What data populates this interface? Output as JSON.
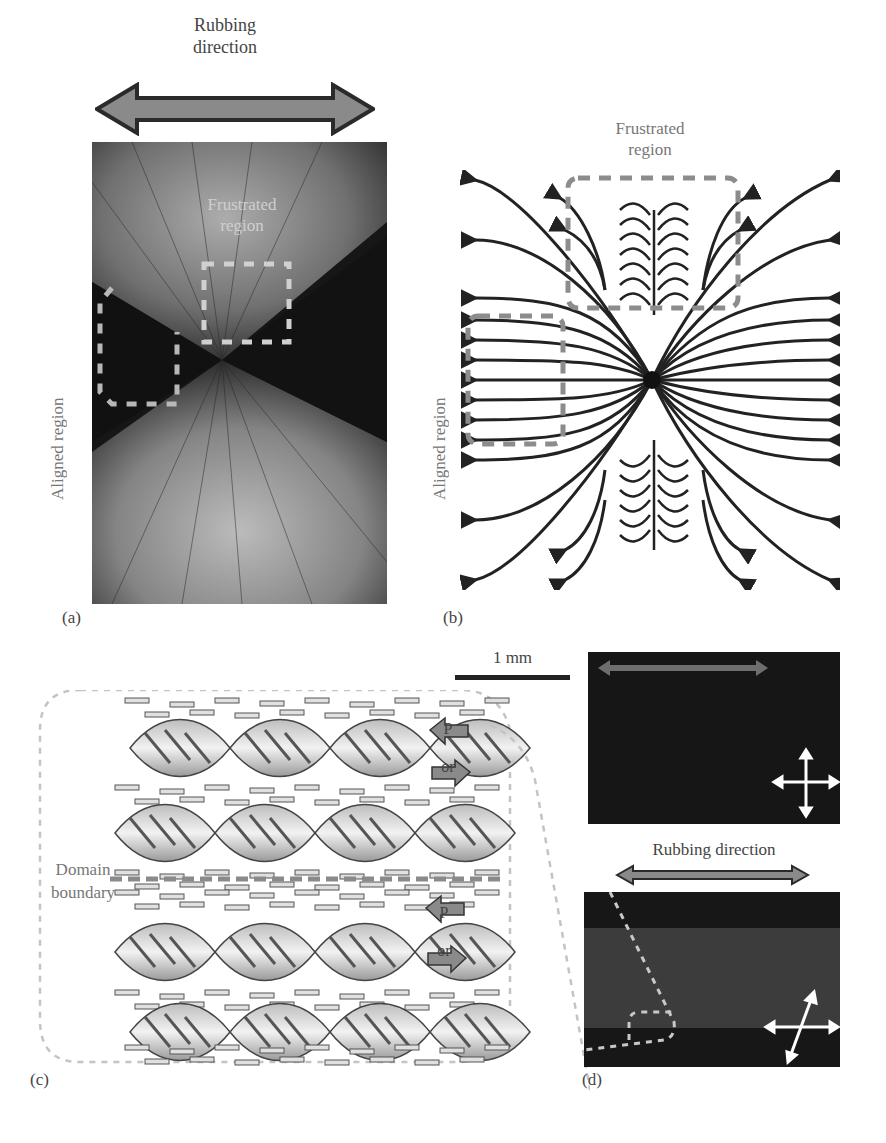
{
  "figure": {
    "panel_a": {
      "letter": "(a)",
      "rubbing_label_line1": "Rubbing",
      "rubbing_label_line2": "direction",
      "frustrated_label_line1": "Frustrated",
      "frustrated_label_line2": "region",
      "aligned_label": "Aligned region"
    },
    "panel_b": {
      "letter": "(b)",
      "frustrated_label_line1": "Frustrated",
      "frustrated_label_line2": "region",
      "aligned_label": "Aligned region"
    },
    "panel_c": {
      "letter": "(c)",
      "scale_bar_label": "1 mm",
      "domain_label_line1": "Domain",
      "domain_label_line2": "boundary",
      "polarization_upper": {
        "label": "P",
        "or": "or"
      },
      "polarization_lower": {
        "label": "P",
        "or": "or"
      }
    },
    "panel_d": {
      "letter": "(d)",
      "rubbing_label": "Rubbing direction"
    },
    "colors": {
      "arrow_fill": "#8a8a8a",
      "arrow_stroke": "#333333",
      "dash_gray": "#8c8c8c",
      "dash_light": "#c8c8c8",
      "photo_dark": "#141414",
      "photo_mid": "#3a3a3a",
      "streamline": "#222222"
    }
  }
}
